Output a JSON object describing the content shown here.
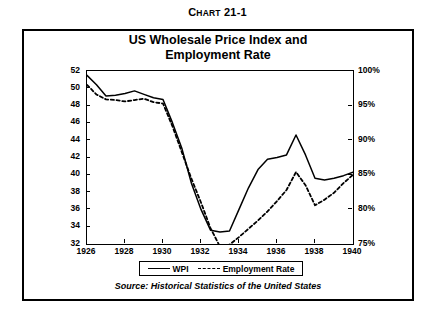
{
  "chart_number": {
    "prefix": "C",
    "small_caps": "HART",
    "number": " 21-1",
    "full": "Chart 21-1"
  },
  "title_line1": "US Wholesale Price Index and",
  "title_line2": "Employment Rate",
  "source": "Source: Historical Statistics of the United States",
  "legend": {
    "wpi_label": "WPI",
    "employment_label": "Employment Rate"
  },
  "colors": {
    "line": "#000000",
    "background": "#ffffff",
    "frame": "#000000"
  },
  "chart_data": {
    "type": "line",
    "title": "US Wholesale Price Index and Employment Rate",
    "subtitle": "Chart 21-1",
    "source": "Source: Historical Statistics of the United States",
    "xlabel": "",
    "ylabel": "",
    "grid": false,
    "legend_position": "bottom",
    "xlim": [
      1926,
      1940
    ],
    "xticks": [
      1926,
      1928,
      1930,
      1932,
      1934,
      1936,
      1938,
      1940
    ],
    "xticklabels": [
      "1926",
      "1928",
      "1930",
      "1932",
      "1934",
      "1936",
      "1938",
      "1940"
    ],
    "yaxis_left": {
      "label": "",
      "ylim": [
        32,
        52
      ],
      "ticks": [
        32,
        34,
        36,
        38,
        40,
        42,
        44,
        46,
        48,
        50,
        52
      ],
      "ticklabels": [
        "32",
        "34",
        "36",
        "38",
        "40",
        "42",
        "44",
        "46",
        "48",
        "50",
        "52"
      ]
    },
    "yaxis_right": {
      "label": "",
      "ylim": [
        75,
        100
      ],
      "ticks": [
        75,
        80,
        85,
        90,
        95,
        100
      ],
      "ticklabels": [
        "75%",
        "80%",
        "85%",
        "90%",
        "95%",
        "100%"
      ]
    },
    "series": [
      {
        "name": "WPI",
        "axis": "left",
        "style": "solid",
        "x": [
          1926,
          1926.5,
          1927,
          1927.5,
          1928,
          1928.5,
          1929,
          1929.5,
          1930,
          1930.5,
          1931,
          1931.5,
          1932,
          1932.5,
          1933,
          1933.5,
          1934,
          1934.5,
          1935,
          1935.5,
          1936,
          1936.5,
          1937,
          1937.5,
          1938,
          1938.5,
          1939,
          1939.5,
          1940
        ],
        "values": [
          51.5,
          50.4,
          49.1,
          49.2,
          49.4,
          49.7,
          49.3,
          48.9,
          48.7,
          46.0,
          43.0,
          39.0,
          36.0,
          33.6,
          33.4,
          33.5,
          36.0,
          38.5,
          40.6,
          41.8,
          42.0,
          42.3,
          44.6,
          42.3,
          39.6,
          39.4,
          39.6,
          39.9,
          40.3
        ]
      },
      {
        "name": "Employment Rate",
        "axis": "right",
        "style": "dashed",
        "x": [
          1926,
          1926.5,
          1927,
          1927.5,
          1928,
          1928.5,
          1929,
          1929.5,
          1930,
          1930.5,
          1931,
          1931.5,
          1932,
          1932.5,
          1933,
          1933.5,
          1934,
          1934.5,
          1935,
          1935.5,
          1936,
          1936.5,
          1937,
          1937.5,
          1938,
          1938.5,
          1939,
          1939.5,
          1940
        ],
        "values": [
          98.0,
          96.6,
          95.9,
          95.8,
          95.6,
          95.8,
          96.0,
          95.5,
          95.3,
          92.0,
          88.2,
          84.4,
          81.0,
          77.3,
          74.6,
          74.9,
          76.0,
          77.2,
          78.4,
          79.7,
          81.2,
          82.8,
          85.4,
          83.5,
          80.6,
          81.4,
          82.4,
          83.8,
          85.0
        ]
      }
    ]
  }
}
